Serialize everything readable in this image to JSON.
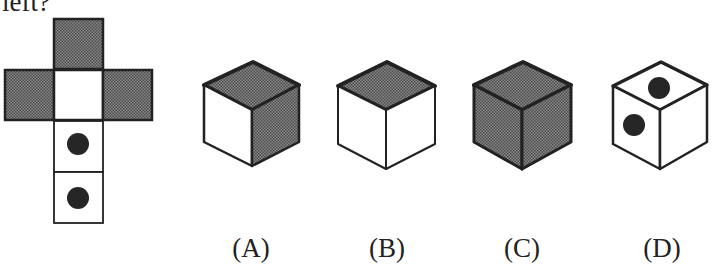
{
  "question": {
    "visible_text": "left?"
  },
  "net": {
    "description": "cube net (cross shape)",
    "faces": [
      {
        "id": "top",
        "fill": "shaded"
      },
      {
        "id": "left",
        "fill": "shaded"
      },
      {
        "id": "center",
        "fill": "blank"
      },
      {
        "id": "right",
        "fill": "shaded"
      },
      {
        "id": "below-1",
        "fill": "dot"
      },
      {
        "id": "below-2",
        "fill": "dot"
      }
    ]
  },
  "options": [
    {
      "label": "(A)",
      "top": "shaded",
      "left": "blank",
      "right": "shaded"
    },
    {
      "label": "(B)",
      "top": "shaded",
      "left": "blank",
      "right": "blank"
    },
    {
      "label": "(C)",
      "top": "shaded",
      "left": "shaded",
      "right": "shaded"
    },
    {
      "label": "(D)",
      "top": "dot",
      "left": "dot",
      "right": "blank"
    }
  ],
  "colors": {
    "stroke": "#222222",
    "shade": "#6e6e6e",
    "dot": "#262626",
    "background": "#ffffff"
  }
}
